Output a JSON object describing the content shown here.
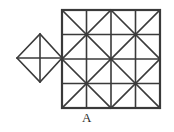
{
  "figure": {
    "label": "A",
    "caption_label": "A",
    "stroke_color": "#3a3a3a",
    "background_color": "#ffffff",
    "stroke_width": 1.6
  },
  "geometry": {
    "grid": {
      "name": "square-grid",
      "left": 62,
      "top": 10,
      "right": 160,
      "bottom": 108,
      "columns": 4,
      "rows": 4,
      "cell_width": 24.5,
      "cell_height": 24.5,
      "x_positions": [
        62,
        86.5,
        111,
        135.5,
        160
      ],
      "y_positions": [
        10,
        34.5,
        59,
        83.5,
        108
      ],
      "diagonal_blocks": [
        {
          "name": "quadrant-top-left",
          "x0": 62,
          "y0": 10,
          "x1": 111,
          "y1": 59
        },
        {
          "name": "quadrant-top-right",
          "x0": 111,
          "y0": 10,
          "x1": 160,
          "y1": 59
        },
        {
          "name": "quadrant-bottom-left",
          "x0": 62,
          "y0": 59,
          "x1": 111,
          "y1": 108
        },
        {
          "name": "quadrant-bottom-right",
          "x0": 111,
          "y0": 59,
          "x1": 160,
          "y1": 108
        }
      ]
    },
    "diamond": {
      "name": "rhombus",
      "left_vertex": [
        17,
        58
      ],
      "top_vertex": [
        40,
        34
      ],
      "right_vertex": [
        62,
        58
      ],
      "bottom_vertex": [
        40,
        82
      ],
      "vertical_median": [
        [
          40,
          34
        ],
        [
          40,
          82
        ]
      ],
      "horizontal_median": [
        [
          17,
          58
        ],
        [
          62,
          58
        ]
      ]
    },
    "label_position": {
      "x": 108,
      "y": 120
    }
  }
}
